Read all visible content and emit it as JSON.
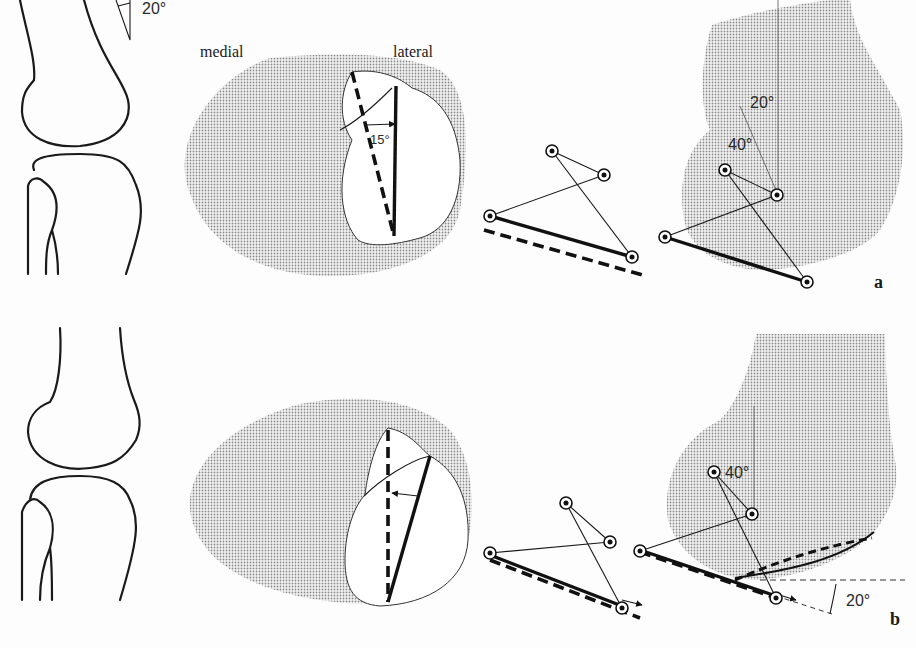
{
  "figure": {
    "panels": [
      {
        "id": "a",
        "panel_label": "a",
        "side_labels": {
          "medial": "medial",
          "lateral": "lateral"
        },
        "angles": {
          "knee_flexion": "20°",
          "rotation": "15°",
          "thigh_axis": "20°",
          "shank_axis": "40°"
        }
      },
      {
        "id": "b",
        "panel_label": "b",
        "angles": {
          "shank_axis": "40°",
          "ground_tilt": "20°"
        }
      }
    ],
    "colors": {
      "ink": "#1a1a1a",
      "stipple": "#b8b8b8",
      "background": "#fdfdfd"
    }
  }
}
